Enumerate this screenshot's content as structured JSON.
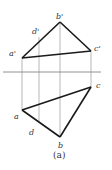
{
  "figure": {
    "caption": "(a)",
    "colors": {
      "thick": "#1a1a1a",
      "thin": "#777777",
      "text": "#333333"
    },
    "points": {
      "a_prime": {
        "label": "a'",
        "x": 22,
        "y": 58
      },
      "b_prime": {
        "label": "b'",
        "x": 60,
        "y": 22
      },
      "c_prime": {
        "label": "c'",
        "x": 91,
        "y": 51
      },
      "d_prime": {
        "label": "d'",
        "x": 39,
        "y": 37
      },
      "a": {
        "label": "a",
        "x": 22,
        "y": 110
      },
      "b": {
        "label": "b",
        "x": 60,
        "y": 137
      },
      "c": {
        "label": "c",
        "x": 91,
        "y": 87
      },
      "d": {
        "label": "d",
        "x": 39,
        "y": 121
      }
    },
    "axis": {
      "x1": 3,
      "x2": 101,
      "y": 72
    }
  }
}
